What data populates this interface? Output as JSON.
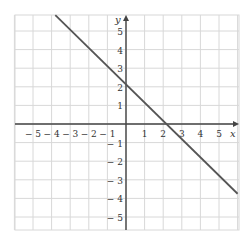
{
  "chart_data": {
    "type": "line",
    "title": "",
    "xlabel": "x",
    "ylabel": "y",
    "xlim": [
      -6,
      6
    ],
    "ylim": [
      -5.7,
      5.85
    ],
    "grid": true,
    "x_ticks": [
      -5,
      -4,
      -3,
      -2,
      -1,
      1,
      2,
      3,
      4,
      5
    ],
    "y_ticks": [
      5,
      4,
      3,
      2,
      1,
      -1,
      -2,
      -3,
      -4,
      5
    ],
    "x_tick_labels": [
      "− 5",
      "− 4",
      "− 3",
      "− 2",
      "− 1",
      "1",
      "2",
      "3",
      "4",
      "5"
    ],
    "y_tick_labels": [
      "5",
      "4",
      "3",
      "2",
      "1",
      "− 1",
      "− 2",
      "− 3",
      "− 4",
      "− 5"
    ],
    "series": [
      {
        "name": "line",
        "equation": "y = -x + 2.25",
        "slope": -1,
        "intercept": 2.25,
        "x": [
          -3.8,
          6
        ],
        "y": [
          5.85,
          -3.75
        ]
      }
    ],
    "colors": {
      "grid": "#d8d8d8",
      "axis": "#444444",
      "line": "#555555",
      "text": "#333333"
    }
  }
}
